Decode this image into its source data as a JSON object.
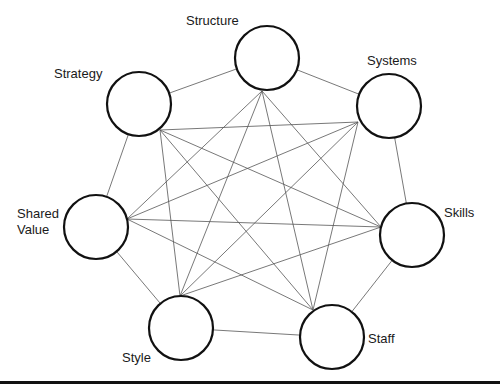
{
  "diagram": {
    "title": "",
    "nodes": [
      {
        "id": "structure",
        "label": "Structure",
        "cx": 267,
        "cy": 58,
        "hub": [
          262,
          91
        ]
      },
      {
        "id": "systems",
        "label": "Systems",
        "cx": 389,
        "cy": 106,
        "hub": [
          358,
          122
        ]
      },
      {
        "id": "skills",
        "label": "Skills",
        "cx": 412,
        "cy": 235,
        "hub": [
          381,
          227
        ]
      },
      {
        "id": "staff",
        "label": "Staff",
        "cx": 332,
        "cy": 337,
        "hub": [
          313,
          310
        ]
      },
      {
        "id": "style",
        "label": "Style",
        "cx": 181,
        "cy": 328,
        "hub": [
          180,
          296
        ]
      },
      {
        "id": "shared-value",
        "label": "Shared\nValue",
        "cx": 96,
        "cy": 227,
        "hub": [
          127,
          219
        ]
      },
      {
        "id": "strategy",
        "label": "Strategy",
        "cx": 139,
        "cy": 104,
        "hub": [
          160,
          130
        ]
      }
    ],
    "radius": 32,
    "labels": {
      "structure": "Structure",
      "systems": "Systems",
      "skills": "Skills",
      "staff": "Staff",
      "style": "Style",
      "shared_value": "Shared\nValue",
      "strategy": "Strategy"
    },
    "edges": "complete-graph",
    "colors": {
      "stroke": "#111111",
      "edge": "#555555",
      "background": "#ffffff"
    }
  }
}
